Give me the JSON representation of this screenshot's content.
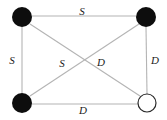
{
  "diagram": {
    "type": "graph",
    "title": "",
    "background_color": "#ffffff",
    "edge_color": "#b4b4b4",
    "label_color": "#1a1a1a",
    "node_filled_color": "#0d0d0d",
    "node_hollow_fill": "#ffffff",
    "node_hollow_stroke": "#2a2a2a",
    "nodes": [
      {
        "id": "top-left",
        "style": "filled",
        "cx": 22,
        "cy": 17,
        "r": 10
      },
      {
        "id": "top-right",
        "style": "filled",
        "cx": 146,
        "cy": 17,
        "r": 10
      },
      {
        "id": "bottom-left",
        "style": "filled",
        "cx": 22,
        "cy": 103,
        "r": 10
      },
      {
        "id": "bottom-right",
        "style": "hollow",
        "cx": 147,
        "cy": 103,
        "r": 9
      }
    ],
    "edges": [
      {
        "id": "top",
        "from": "top-left",
        "to": "top-right",
        "label": "S",
        "label_x": 82,
        "label_y": 11
      },
      {
        "id": "left",
        "from": "top-left",
        "to": "bottom-left",
        "label": "S",
        "label_y": 60,
        "label_x": 12
      },
      {
        "id": "right",
        "from": "top-right",
        "to": "bottom-right",
        "label": "D",
        "label_x": 155,
        "label_y": 60
      },
      {
        "id": "bottom",
        "from": "bottom-left",
        "to": "bottom-right",
        "label": "D",
        "label_x": 83,
        "label_y": 110
      },
      {
        "id": "diagonal-left",
        "from": "bottom-left",
        "to": "top-right",
        "label": "S",
        "label_x": 62,
        "label_y": 63
      },
      {
        "id": "diagonal-right",
        "from": "top-left",
        "to": "bottom-right",
        "label": "D",
        "label_x": 101,
        "label_y": 62
      }
    ],
    "labels": {
      "top": "S",
      "left": "S",
      "right": "D",
      "bottom": "D",
      "diagonal_left": "S",
      "diagonal_right": "D"
    }
  }
}
